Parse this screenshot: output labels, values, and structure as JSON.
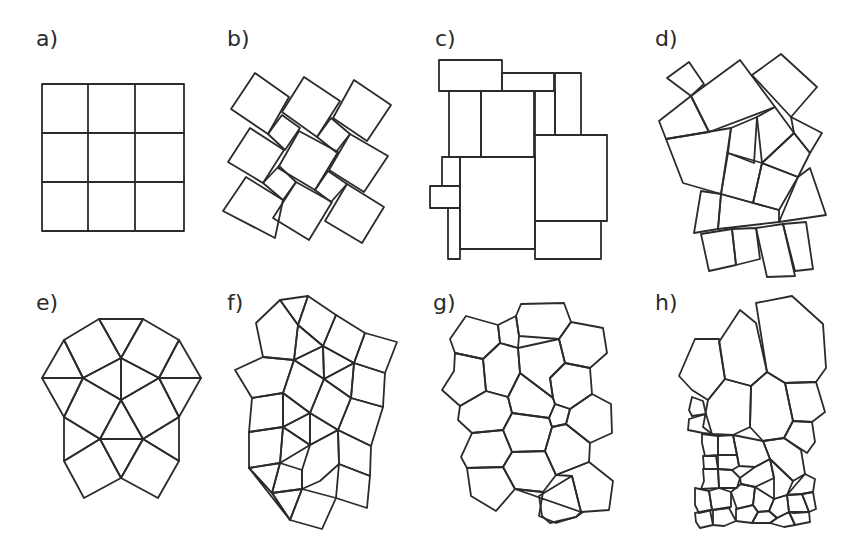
{
  "figure": {
    "panels": [
      {
        "id": "a",
        "label": "a)",
        "description": "square grid tiling 3x3"
      },
      {
        "id": "b",
        "label": "b)",
        "description": "pinwheel / Pythagorean tiling of rotated squares"
      },
      {
        "id": "c",
        "label": "c)",
        "description": "irregular rectangle packing"
      },
      {
        "id": "d",
        "label": "d)",
        "description": "irregular quadrilateral tiling"
      },
      {
        "id": "e",
        "label": "e)",
        "description": "snub square tiling of triangles and squares"
      },
      {
        "id": "f",
        "label": "f)",
        "description": "distorted triangle-square-pentagon tiling"
      },
      {
        "id": "g",
        "label": "g)",
        "description": "Voronoi-like pentagon/hexagon tiling, uniform cells"
      },
      {
        "id": "h",
        "label": "h)",
        "description": "Voronoi-like tiling with size gradient (large top, small bottom)"
      }
    ],
    "stroke_color": "#2b2b2b",
    "background": "#ffffff"
  }
}
